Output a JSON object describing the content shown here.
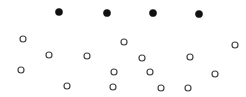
{
  "canvas": {
    "width": 246,
    "height": 97,
    "background": "#ffffff"
  },
  "styles": {
    "filled": {
      "fill": "#111111",
      "stroke": "#111111",
      "r": 3.6,
      "stroke_width": 0.5
    },
    "open": {
      "fill": "#ffffff",
      "stroke": "#444444",
      "r": 3.0,
      "stroke_width": 1.2
    }
  },
  "filled_dots": [
    {
      "x": 59,
      "y": 12
    },
    {
      "x": 107,
      "y": 13
    },
    {
      "x": 153,
      "y": 13
    },
    {
      "x": 199,
      "y": 14
    }
  ],
  "open_dots": [
    {
      "x": 23,
      "y": 39
    },
    {
      "x": 124,
      "y": 42
    },
    {
      "x": 235,
      "y": 45
    },
    {
      "x": 49,
      "y": 55
    },
    {
      "x": 87,
      "y": 56
    },
    {
      "x": 142,
      "y": 58
    },
    {
      "x": 190,
      "y": 57
    },
    {
      "x": 21,
      "y": 70
    },
    {
      "x": 114,
      "y": 72
    },
    {
      "x": 150,
      "y": 72
    },
    {
      "x": 215,
      "y": 74
    },
    {
      "x": 67,
      "y": 86
    },
    {
      "x": 113,
      "y": 87
    },
    {
      "x": 161,
      "y": 88
    },
    {
      "x": 188,
      "y": 88
    }
  ],
  "counts": {
    "filled": 4,
    "open": 15
  }
}
